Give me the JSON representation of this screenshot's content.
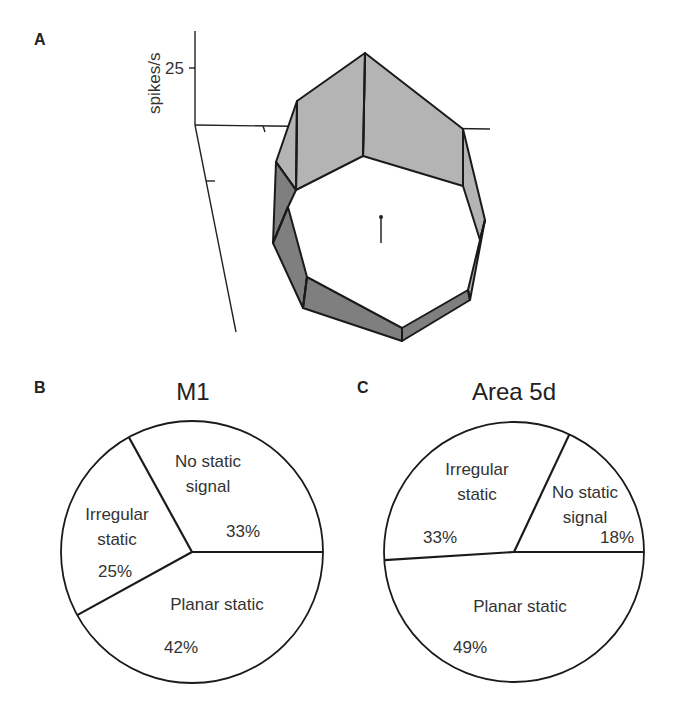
{
  "panels": {
    "a": {
      "letter": "A",
      "ylabel": "spikes/s",
      "ytick_label": "25"
    },
    "b": {
      "letter": "B"
    },
    "c": {
      "letter": "C"
    }
  },
  "colors": {
    "wall_light": "#b4b4b4",
    "wall_dark": "#7f7f7f",
    "line": "#1a1a1a",
    "pie_fill": "#ffffff"
  },
  "chart_data": [
    {
      "type": "other",
      "subtype": "3d-polygon-ring",
      "panel": "A",
      "title": "",
      "ylabel": "spikes/s",
      "yticks": [
        25
      ],
      "description": "3D surface of firing rate (spikes/s) across directions on a plane, drawn as a shaded polygonal ring wall"
    },
    {
      "type": "pie",
      "panel": "B",
      "title": "M1",
      "slices": [
        {
          "label_lines": [
            "No static",
            "signal"
          ],
          "value": 33,
          "value_label": "33%"
        },
        {
          "label_lines": [
            "Irregular",
            "static"
          ],
          "value": 25,
          "value_label": "25%"
        },
        {
          "label_lines": [
            "Planar static"
          ],
          "value": 42,
          "value_label": "42%"
        }
      ]
    },
    {
      "type": "pie",
      "panel": "C",
      "title": "Area 5d",
      "slices": [
        {
          "label_lines": [
            "No static",
            "signal"
          ],
          "value": 18,
          "value_label": "18%"
        },
        {
          "label_lines": [
            "Irregular",
            "static"
          ],
          "value": 33,
          "value_label": "33%"
        },
        {
          "label_lines": [
            "Planar static"
          ],
          "value": 49,
          "value_label": "49%"
        }
      ]
    }
  ]
}
